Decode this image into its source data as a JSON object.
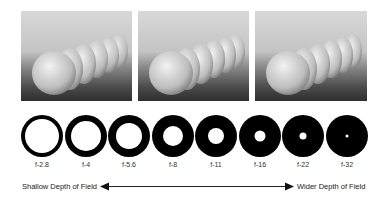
{
  "photos": [
    {
      "name": "eggs-photo-shallow",
      "desc": "row of eggs, shallow depth of field"
    },
    {
      "name": "eggs-photo-medium",
      "desc": "row of eggs, medium depth of field"
    },
    {
      "name": "eggs-photo-wide",
      "desc": "row of eggs, wide depth of field"
    }
  ],
  "apertures": [
    {
      "label": "f-2.8",
      "hole": 34
    },
    {
      "label": "f-4",
      "hole": 30
    },
    {
      "label": "f-5.6",
      "hole": 26
    },
    {
      "label": "f-8",
      "hole": 20
    },
    {
      "label": "f-11",
      "hole": 16
    },
    {
      "label": "f-16",
      "hole": 11
    },
    {
      "label": "f-22",
      "hole": 7
    },
    {
      "label": "f-32",
      "hole": 3
    }
  ],
  "scale": {
    "left_label": "Shallow Depth of Field",
    "right_label": "Wider Depth of Field"
  },
  "colors": {
    "aperture": "#000000",
    "text": "#222222"
  }
}
